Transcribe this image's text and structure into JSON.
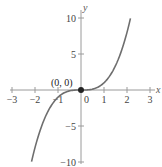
{
  "chart_data": {
    "type": "line",
    "title": "",
    "xlabel": "x",
    "ylabel": "y",
    "xlim": [
      -3,
      3
    ],
    "ylim": [
      -10,
      10
    ],
    "grid": false,
    "x_ticks": [
      -3,
      -2,
      -1,
      0,
      1,
      2,
      3
    ],
    "x_tick_labels": [
      "−3",
      "−2",
      "−1",
      "0",
      "1",
      "2",
      "3"
    ],
    "y_ticks": [
      -10,
      -5,
      5,
      10
    ],
    "y_tick_labels": [
      "−10",
      "−5",
      "5",
      "10"
    ],
    "series": [
      {
        "name": "y = x^3",
        "color": "#6e6e6e",
        "x": [
          -2.15,
          -2,
          -1.5,
          -1,
          -0.5,
          0,
          0.5,
          1,
          1.5,
          2,
          2.15
        ],
        "y": [
          -9.94,
          -8,
          -3.38,
          -1,
          -0.13,
          0,
          0.13,
          1,
          3.38,
          8,
          9.94
        ]
      }
    ],
    "annotations": [
      {
        "text": "(0, 0)",
        "x": 0,
        "y": 0,
        "marker": "filled-circle",
        "color": "#222222"
      }
    ]
  },
  "colors": {
    "axis": "#9a9a9a",
    "curve": "#6e6e6e",
    "point": "#222222",
    "text": "#444444"
  }
}
